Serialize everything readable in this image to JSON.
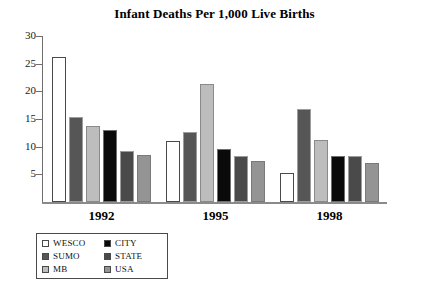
{
  "chart_data": {
    "type": "bar",
    "title": "Infant Deaths Per 1,000 Live Births",
    "xlabel": "",
    "ylabel": "",
    "categories": [
      "1992",
      "1995",
      "1998"
    ],
    "ylim": [
      0,
      30
    ],
    "yticks": [
      5,
      10,
      15,
      20,
      25,
      30
    ],
    "ytick_labels": [
      "5",
      "10",
      "15",
      "20",
      "25",
      "30"
    ],
    "grid": false,
    "legend_position": "bottom-left",
    "series": [
      {
        "name": "WESCO",
        "color": "#ffffff",
        "values": [
          26.2,
          11.0,
          5.3
        ]
      },
      {
        "name": "SUMO",
        "color": "#565656",
        "values": [
          15.3,
          12.6,
          16.8
        ]
      },
      {
        "name": "MB",
        "color": "#bdbdbd",
        "values": [
          13.7,
          21.3,
          11.2
        ]
      },
      {
        "name": "CITY",
        "color": "#0a0a0a",
        "values": [
          13.1,
          9.5,
          8.4
        ]
      },
      {
        "name": "STATE",
        "color": "#4a4a4a",
        "values": [
          9.3,
          8.4,
          8.3
        ]
      },
      {
        "name": "USA",
        "color": "#949494",
        "values": [
          8.5,
          7.5,
          7.1
        ]
      }
    ]
  },
  "legend": {
    "items": [
      {
        "label": "WESCO",
        "key": "wesco"
      },
      {
        "label": "CITY",
        "key": "city"
      },
      {
        "label": "SUMO",
        "key": "sumo"
      },
      {
        "label": "STATE",
        "key": "state"
      },
      {
        "label": "MB",
        "key": "mb"
      },
      {
        "label": "USA",
        "key": "usa"
      }
    ]
  }
}
